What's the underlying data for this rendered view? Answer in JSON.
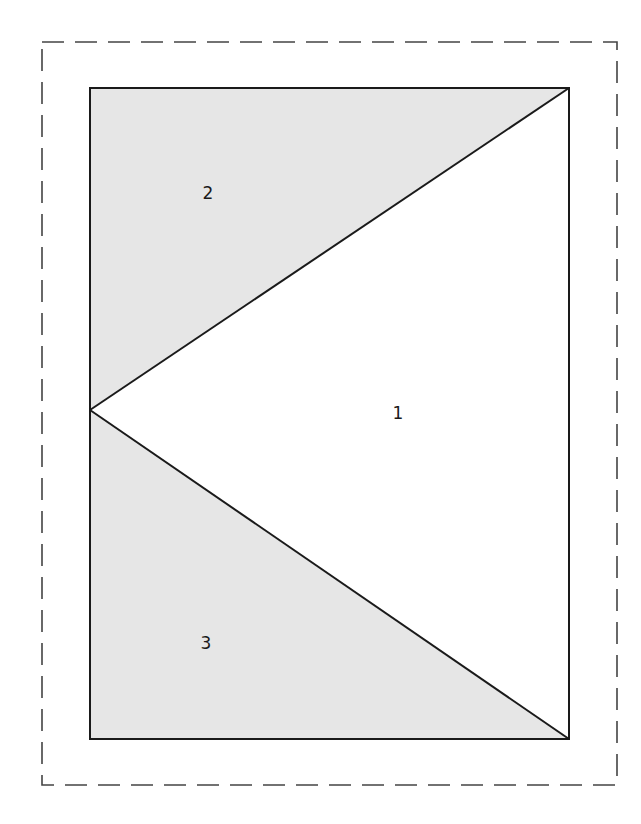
{
  "diagram": {
    "type": "quilt-block-flying-geese-template",
    "colors": {
      "shaded": "#e6e6e6",
      "unshaded": "#ffffff",
      "line": "#1a1a1a",
      "dashed": "#444444"
    },
    "outer_seam_allowance": {
      "style": "dashed",
      "x1": 42,
      "y1": 42,
      "x2": 617,
      "y2": 785
    },
    "block": {
      "x1": 90,
      "y1": 88,
      "x2": 569,
      "y2": 739
    },
    "pieces": [
      {
        "label": "1",
        "shaded": false,
        "points": [
          [
            90,
            410
          ],
          [
            569,
            88
          ],
          [
            569,
            739
          ]
        ],
        "label_pos": [
          398,
          419
        ]
      },
      {
        "label": "2",
        "shaded": true,
        "points": [
          [
            90,
            88
          ],
          [
            569,
            88
          ],
          [
            90,
            410
          ]
        ],
        "label_pos": [
          208,
          199
        ]
      },
      {
        "label": "3",
        "shaded": true,
        "points": [
          [
            90,
            410
          ],
          [
            569,
            739
          ],
          [
            90,
            739
          ]
        ],
        "label_pos": [
          206,
          649
        ]
      }
    ]
  }
}
